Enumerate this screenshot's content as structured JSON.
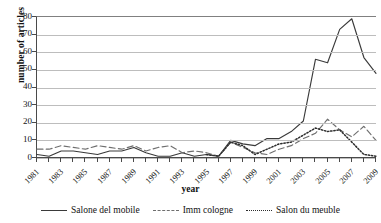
{
  "chart_data": {
    "type": "line",
    "title": "",
    "xlabel": "year",
    "ylabel": "number of articles",
    "xlim": [
      1981,
      2009
    ],
    "ylim": [
      0,
      80
    ],
    "yticks": [
      0,
      10,
      20,
      30,
      40,
      50,
      60,
      70,
      80
    ],
    "grid": true,
    "legend_position": "bottom",
    "x": [
      1981,
      1982,
      1983,
      1984,
      1985,
      1986,
      1987,
      1988,
      1989,
      1990,
      1991,
      1992,
      1993,
      1994,
      1995,
      1996,
      1997,
      1998,
      1999,
      2000,
      2001,
      2002,
      2003,
      2004,
      2005,
      2006,
      2007,
      2008,
      2009
    ],
    "xtick_labels": [
      "1981",
      "1983",
      "1985",
      "1987",
      "1989",
      "1991",
      "1993",
      "1995",
      "1997",
      "1999",
      "2001",
      "2003",
      "2005",
      "2007",
      "2009"
    ],
    "series": [
      {
        "name": "Salone del mobile",
        "style": "solid",
        "color": "#3a3a3a",
        "values": [
          2,
          1,
          4,
          4,
          3,
          2,
          4,
          4,
          6,
          3,
          1,
          1,
          3,
          1,
          2,
          1,
          10,
          8,
          7,
          11,
          11,
          15,
          21,
          56,
          54,
          73,
          79,
          57,
          48
        ]
      },
      {
        "name": "Imm cologne",
        "style": "dashed",
        "color": "#6e6e6e",
        "values": [
          5,
          5,
          7,
          6,
          5,
          7,
          6,
          5,
          7,
          4,
          6,
          7,
          3,
          4,
          3,
          1,
          9,
          6,
          3,
          2,
          5,
          7,
          11,
          14,
          22,
          16,
          12,
          18,
          10
        ]
      },
      {
        "name": "Salon du meuble",
        "style": "dotted",
        "color": "#2e2e2e",
        "values": [
          null,
          null,
          null,
          null,
          null,
          null,
          null,
          null,
          null,
          null,
          null,
          null,
          null,
          null,
          2,
          1,
          9,
          7,
          2,
          5,
          8,
          9,
          13,
          17,
          15,
          16,
          9,
          2,
          1
        ]
      }
    ]
  },
  "legend": {
    "items": [
      {
        "label": "Salone del mobile",
        "style": "solid"
      },
      {
        "label": "Imm cologne",
        "style": "dashed"
      },
      {
        "label": "Salon du meuble",
        "style": "dotted"
      }
    ]
  }
}
